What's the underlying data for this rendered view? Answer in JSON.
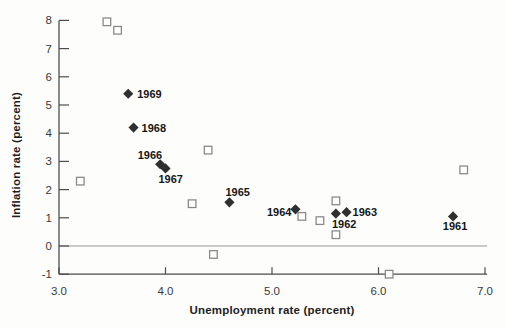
{
  "chart_data": {
    "type": "scatter",
    "title": "",
    "xlabel": "Unemployment rate (percent)",
    "ylabel": "Inflation rate (percent)",
    "xlim": [
      3.0,
      7.0
    ],
    "ylim": [
      -1.0,
      8.0
    ],
    "x_ticks": [
      3,
      4,
      5,
      6,
      7
    ],
    "x_tick_labels": [
      "3.0",
      "4.0",
      "5.0",
      "6.0",
      "7.0"
    ],
    "y_ticks": [
      8,
      7,
      6,
      5,
      4,
      3,
      2,
      1,
      0,
      -1
    ],
    "y_tick_labels": [
      "8",
      "7",
      "6",
      "5",
      "4",
      "3",
      "2",
      "1",
      "0",
      "-1"
    ],
    "grid": false,
    "legend": false,
    "zero_line": {
      "y": 0,
      "color": "#b9b9b9"
    },
    "axis_color": "#4d4d4d",
    "series": [
      {
        "name": "labeled-years",
        "marker": "filled-diamond",
        "color": "#2f2f2f",
        "points": [
          {
            "x": 6.7,
            "y": 1.05,
            "label": "1961",
            "label_anchor": "middle",
            "dx": 2,
            "dy": 14
          },
          {
            "x": 5.6,
            "y": 1.15,
            "label": "1962",
            "label_anchor": "start",
            "dx": -4,
            "dy": 14
          },
          {
            "x": 5.7,
            "y": 1.2,
            "label": "1963",
            "label_anchor": "start",
            "dx": 6,
            "dy": 4
          },
          {
            "x": 5.22,
            "y": 1.3,
            "label": "1964",
            "label_anchor": "end",
            "dx": -4,
            "dy": 7
          },
          {
            "x": 4.6,
            "y": 1.55,
            "label": "1965",
            "label_anchor": "start",
            "dx": -4,
            "dy": -6
          },
          {
            "x": 3.95,
            "y": 2.9,
            "label": "1966",
            "label_anchor": "end",
            "dx": 2,
            "dy": -5
          },
          {
            "x": 4.0,
            "y": 2.75,
            "label": "1967",
            "label_anchor": "start",
            "dx": -7,
            "dy": 15
          },
          {
            "x": 3.7,
            "y": 4.2,
            "label": "1968",
            "label_anchor": "start",
            "dx": 8,
            "dy": 4
          },
          {
            "x": 3.65,
            "y": 5.4,
            "label": "1969",
            "label_anchor": "start",
            "dx": 9,
            "dy": 4
          }
        ]
      },
      {
        "name": "unlabeled-years",
        "marker": "open-square",
        "color": "#8a8a8a",
        "points": [
          {
            "x": 3.45,
            "y": 7.95
          },
          {
            "x": 3.55,
            "y": 7.65
          },
          {
            "x": 3.2,
            "y": 2.3
          },
          {
            "x": 4.4,
            "y": 3.4
          },
          {
            "x": 4.25,
            "y": 1.5
          },
          {
            "x": 4.45,
            "y": -0.3
          },
          {
            "x": 5.28,
            "y": 1.05
          },
          {
            "x": 5.6,
            "y": 1.6
          },
          {
            "x": 5.45,
            "y": 0.9
          },
          {
            "x": 5.6,
            "y": 0.4
          },
          {
            "x": 6.1,
            "y": -1.0
          },
          {
            "x": 6.8,
            "y": 2.7
          }
        ]
      }
    ]
  }
}
